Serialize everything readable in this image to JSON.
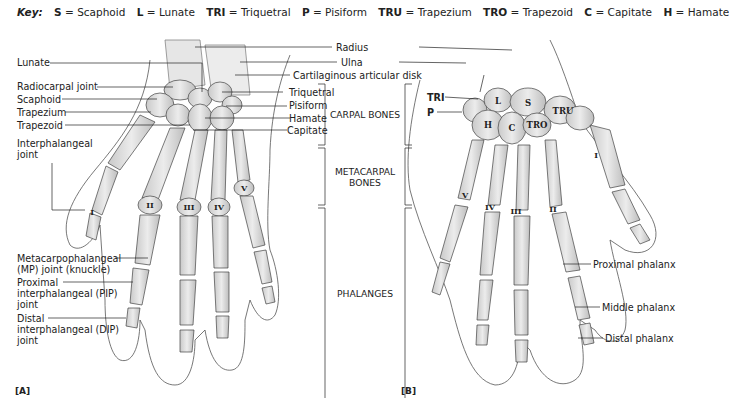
{
  "key": {
    "title": "Key:",
    "items": [
      {
        "abbr": "S",
        "name": "Scaphoid"
      },
      {
        "abbr": "L",
        "name": "Lunate"
      },
      {
        "abbr": "TRI",
        "name": "Triquetral"
      },
      {
        "abbr": "P",
        "name": "Pisiform"
      },
      {
        "abbr": "TRU",
        "name": "Trapezium"
      },
      {
        "abbr": "TRO",
        "name": "Trapezoid"
      },
      {
        "abbr": "C",
        "name": "Capitate"
      },
      {
        "abbr": "H",
        "name": "Hamate"
      }
    ],
    "equals": "="
  },
  "figure_a": {
    "label": "[A]",
    "left_labels": {
      "lunate": "Lunate",
      "radiocarpal_joint": "Radiocarpal joint",
      "scaphoid": "Scaphoid",
      "trapezium": "Trapezium",
      "trapezoid": "Trapezoid",
      "interphalangeal_joint_1": "Interphalangeal",
      "interphalangeal_joint_2": "joint",
      "mp_joint_1": "Metacarpophalangeal",
      "mp_joint_2": "(MP) joint (knuckle)",
      "pip_joint_1": "Proximal",
      "pip_joint_2": "interphalangeal (PIP)",
      "pip_joint_3": "joint",
      "dip_joint_1": "Distal",
      "dip_joint_2": "interphalangeal (DIP)",
      "dip_joint_3": "joint"
    },
    "right_labels": {
      "triquetral": "Triquetral",
      "pisiform": "Pisiform",
      "hamate": "Hamate",
      "capitate": "Capitate"
    },
    "metacarpal_numerals": [
      "I",
      "II",
      "III",
      "IV",
      "V"
    ]
  },
  "center_labels": {
    "radius": "Radius",
    "ulna": "Ulna",
    "disk": "Cartilaginous articular disk",
    "carpal_bones": "CARPAL BONES",
    "metacarpal_1": "METACARPAL",
    "metacarpal_2": "BONES",
    "phalanges": "PHALANGES"
  },
  "figure_b": {
    "label": "[B]",
    "bone_labels": {
      "tri": "TRI",
      "p": "P",
      "l": "L",
      "s": "S",
      "h": "H",
      "c": "C",
      "tro": "TRO",
      "tru": "TRU"
    },
    "metacarpal_numerals": [
      "V",
      "IV",
      "III",
      "II",
      "I"
    ],
    "right_labels": {
      "proximal_phalanx": "Proximal phalanx",
      "middle_phalanx": "Middle phalanx",
      "distal_phalanx": "Distal phalanx"
    }
  }
}
